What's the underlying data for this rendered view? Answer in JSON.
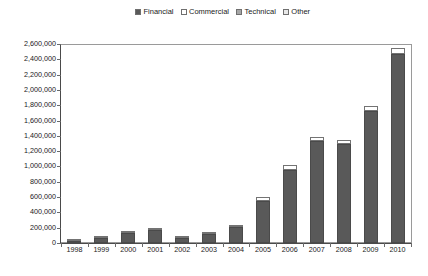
{
  "legend": {
    "position": "top-center",
    "items": [
      {
        "label": "Financial",
        "key": "financial",
        "color": "#595959"
      },
      {
        "label": "Commercial",
        "key": "commercial",
        "color": "#ffffff"
      },
      {
        "label": "Technical",
        "key": "technical",
        "color": "#a6a6a6"
      },
      {
        "label": "Other",
        "key": "other",
        "color": "#e8e8e8"
      }
    ]
  },
  "caption": "",
  "chart_data": {
    "type": "bar",
    "subtype": "stacked-column",
    "title": "",
    "subtitle": "",
    "xlabel": "",
    "ylabel": "",
    "grid": false,
    "legend_position": "top-center",
    "ylim": [
      0,
      2600000
    ],
    "ytick_step": 200000,
    "ytick_labels": [
      "0",
      "200,000",
      "400,000",
      "600,000",
      "800,000",
      "1,000,000",
      "1,200,000",
      "1,400,000",
      "1,600,000",
      "1,800,000",
      "2,000,000",
      "2,200,000",
      "2,400,000",
      "2,600,000"
    ],
    "ytick_values": [
      0,
      200000,
      400000,
      600000,
      800000,
      1000000,
      1200000,
      1400000,
      1600000,
      1800000,
      2000000,
      2200000,
      2400000,
      2600000
    ],
    "categories": [
      "1998",
      "1999",
      "2000",
      "2001",
      "2002",
      "2003",
      "2004",
      "2005",
      "2006",
      "2007",
      "2008",
      "2009",
      "2010"
    ],
    "series": [
      {
        "name": "Financial",
        "color": "#595959",
        "values": [
          20000,
          60000,
          130000,
          175000,
          60000,
          120000,
          205000,
          545000,
          960000,
          1330000,
          1290000,
          1730000,
          2470000
        ]
      },
      {
        "name": "Commercial",
        "color": "#ffffff",
        "values": [
          4000,
          8000,
          12000,
          15000,
          8000,
          15000,
          25000,
          50000,
          65000,
          60000,
          60000,
          55000,
          75000
        ]
      },
      {
        "name": "Technical",
        "color": "#a6a6a6",
        "values": [
          0,
          0,
          0,
          0,
          0,
          0,
          0,
          0,
          0,
          0,
          0,
          0,
          0
        ]
      },
      {
        "name": "Other",
        "color": "#e8e8e8",
        "values": [
          0,
          0,
          0,
          0,
          0,
          0,
          0,
          0,
          0,
          0,
          0,
          0,
          0
        ]
      }
    ],
    "totals": [
      24000,
      68000,
      142000,
      190000,
      68000,
      135000,
      230000,
      595000,
      1025000,
      1390000,
      1350000,
      1785000,
      2545000
    ]
  }
}
